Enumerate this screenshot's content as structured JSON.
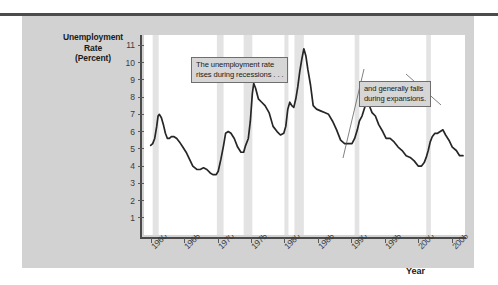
{
  "figure": {
    "y_axis_title_lines": [
      "Unemployment",
      "Rate",
      "(Percent)"
    ],
    "x_axis_title": "Year"
  },
  "chart_data": {
    "type": "line",
    "title": "Unemployment Rate (Percent)",
    "xlabel": "Year",
    "ylabel": "Unemployment Rate (Percent)",
    "xlim": [
      1959,
      2007
    ],
    "ylim": [
      0,
      11.6
    ],
    "grid": false,
    "legend": "none",
    "yticks": [
      1,
      2,
      3,
      4,
      5,
      6,
      7,
      8,
      9,
      10,
      11
    ],
    "xticks": [
      1960,
      1965,
      1970,
      1975,
      1980,
      1985,
      1990,
      1995,
      2000,
      2005
    ],
    "xtick_labels": [
      "1960",
      "1965",
      "1970",
      "1975",
      "1980",
      "1985",
      "1990",
      "1995",
      "2000",
      "2005"
    ],
    "series": [
      {
        "name": "Unemployment Rate",
        "color": "#262626",
        "x": [
          1960.0,
          1960.3,
          1960.6,
          1960.9,
          1961.1,
          1961.3,
          1961.6,
          1961.9,
          1962.2,
          1962.5,
          1962.8,
          1963.1,
          1963.5,
          1963.9,
          1964.3,
          1964.8,
          1965.3,
          1965.8,
          1966.3,
          1966.9,
          1967.4,
          1967.9,
          1968.4,
          1968.9,
          1969.3,
          1969.8,
          1970.1,
          1970.5,
          1970.9,
          1971.2,
          1971.6,
          1972.0,
          1972.5,
          1973.0,
          1973.5,
          1973.9,
          1974.2,
          1974.6,
          1974.9,
          1975.2,
          1975.4,
          1975.7,
          1976.1,
          1976.6,
          1977.1,
          1977.7,
          1978.3,
          1978.9,
          1979.4,
          1979.9,
          1980.2,
          1980.5,
          1980.8,
          1981.1,
          1981.4,
          1981.7,
          1982.0,
          1982.3,
          1982.6,
          1982.9,
          1983.2,
          1983.5,
          1983.9,
          1984.3,
          1984.8,
          1985.4,
          1986.0,
          1986.6,
          1987.2,
          1987.8,
          1988.4,
          1989.0,
          1989.6,
          1990.1,
          1990.5,
          1990.9,
          1991.2,
          1991.6,
          1992.0,
          1992.4,
          1992.7,
          1993.1,
          1993.6,
          1994.1,
          1994.7,
          1995.2,
          1995.8,
          1996.4,
          1997.0,
          1997.6,
          1998.2,
          1998.8,
          1999.4,
          2000.0,
          2000.5,
          2000.9,
          2001.2,
          2001.5,
          2001.8,
          2002.1,
          2002.5,
          2002.9,
          2003.3,
          2003.7,
          2004.1,
          2004.6,
          2005.1,
          2005.7,
          2006.2,
          2006.7
        ],
        "y": [
          5.2,
          5.3,
          5.6,
          6.3,
          6.9,
          7.0,
          6.8,
          6.4,
          5.9,
          5.6,
          5.6,
          5.7,
          5.7,
          5.6,
          5.4,
          5.1,
          4.8,
          4.4,
          4.0,
          3.8,
          3.8,
          3.9,
          3.8,
          3.6,
          3.5,
          3.5,
          3.7,
          4.4,
          5.2,
          5.9,
          6.0,
          5.9,
          5.6,
          5.1,
          4.8,
          4.8,
          5.2,
          5.6,
          6.6,
          8.2,
          8.8,
          8.5,
          7.9,
          7.7,
          7.5,
          7.1,
          6.3,
          6.0,
          5.8,
          5.9,
          6.3,
          7.3,
          7.7,
          7.5,
          7.4,
          7.9,
          8.6,
          9.5,
          10.2,
          10.8,
          10.4,
          9.6,
          8.7,
          7.5,
          7.3,
          7.2,
          7.1,
          7.0,
          6.6,
          6.1,
          5.5,
          5.3,
          5.3,
          5.3,
          5.6,
          6.1,
          6.6,
          6.9,
          7.4,
          7.7,
          7.5,
          7.1,
          6.9,
          6.4,
          6.0,
          5.6,
          5.6,
          5.4,
          5.1,
          4.9,
          4.6,
          4.5,
          4.3,
          4.0,
          4.0,
          4.2,
          4.5,
          4.9,
          5.4,
          5.7,
          5.9,
          5.9,
          6.0,
          6.1,
          5.8,
          5.5,
          5.1,
          4.9,
          4.6,
          4.6
        ]
      }
    ],
    "recession_bands": [
      {
        "start": 1960.3,
        "end": 1961.2
      },
      {
        "start": 1969.9,
        "end": 1970.9
      },
      {
        "start": 1973.9,
        "end": 1975.2
      },
      {
        "start": 1980.0,
        "end": 1980.6
      },
      {
        "start": 1981.5,
        "end": 1982.9
      },
      {
        "start": 1990.5,
        "end": 1991.2
      },
      {
        "start": 2001.2,
        "end": 2001.9
      }
    ],
    "recession_band_color": "#e3e3e3",
    "annotations": [
      {
        "id": "recessions-note",
        "lines": [
          "The unemployment rate",
          "rises during recessions . . ."
        ],
        "leader_from": [
          262,
          39
        ],
        "leader_to": [
          297,
          70
        ]
      },
      {
        "id": "expansions-note",
        "lines": [
          "and generally falls",
          "during expansions."
        ],
        "leader_from": [
          220,
          34
        ],
        "leader_to": [
          199,
          123
        ]
      }
    ]
  }
}
